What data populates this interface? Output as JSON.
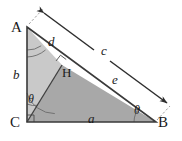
{
  "figure": {
    "canvas": {
      "width": 182,
      "height": 141
    },
    "colors": {
      "stroke": "#4a4a4a",
      "label": "#1a1a1a",
      "fill_upper": "#c9c9c9",
      "fill_lower": "#a8a8a8",
      "arc": "#6b6b6b",
      "dimension": "#3a3a3a",
      "dashed": "#9a9a9a",
      "background": "#ffffff"
    },
    "vertices": [
      {
        "id": "A",
        "label": "A",
        "x": 27,
        "y": 27,
        "label_x": 11,
        "label_y": 20
      },
      {
        "id": "C",
        "label": "C",
        "x": 27,
        "y": 122,
        "label_x": 10,
        "label_y": 115
      },
      {
        "id": "B",
        "label": "B",
        "x": 156,
        "y": 122,
        "label_x": 158,
        "label_y": 115
      },
      {
        "id": "H",
        "label": "H",
        "x": 62,
        "y": 65,
        "label_x": 62,
        "label_y": 66
      }
    ],
    "sides": [
      {
        "id": "a",
        "label": "a",
        "label_x": 88,
        "label_y": 112,
        "desc": "base CB"
      },
      {
        "id": "b",
        "label": "b",
        "label_x": 13,
        "label_y": 68,
        "desc": "leg AC"
      },
      {
        "id": "c",
        "label": "c",
        "label_x": 101,
        "label_y": 44,
        "desc": "hypotenuse AB dimension"
      },
      {
        "id": "d",
        "label": "d",
        "label_x": 48,
        "label_y": 35,
        "desc": "segment AH"
      },
      {
        "id": "e",
        "label": "e",
        "label_x": 112,
        "label_y": 73,
        "desc": "segment HB"
      }
    ],
    "angles": [
      {
        "id": "theta-c",
        "label": "θ",
        "label_x": 28,
        "label_y": 93,
        "desc": "angle ACH at C"
      },
      {
        "id": "theta-b",
        "label": "θ",
        "label_x": 134,
        "label_y": 104,
        "desc": "angle at B"
      }
    ],
    "markers": [
      {
        "id": "right-angle-c",
        "desc": "right angle at C"
      },
      {
        "id": "right-angle-h",
        "desc": "right angle at H on AB"
      }
    ],
    "dimension_line": {
      "id": "c-dimension",
      "label": "c",
      "arrow_start": "A",
      "arrow_end": "B",
      "double_headed": true
    }
  }
}
